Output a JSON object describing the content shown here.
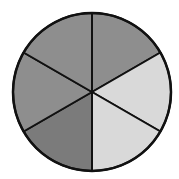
{
  "diagram": {
    "type": "fraction-circle",
    "total_sectors": 6,
    "center": [
      92,
      92
    ],
    "radius": 79,
    "stroke_color": "#111111",
    "stroke_width": 2,
    "sectors": [
      {
        "index": 0,
        "position": "top-right",
        "start_deg": -90,
        "end_deg": -30,
        "fill": "#8e8e8e",
        "shade": "dark"
      },
      {
        "index": 1,
        "position": "right-upper",
        "start_deg": -30,
        "end_deg": 30,
        "fill": "#d9d9d9",
        "shade": "light"
      },
      {
        "index": 2,
        "position": "bottom-right",
        "start_deg": 30,
        "end_deg": 90,
        "fill": "#d9d9d9",
        "shade": "light"
      },
      {
        "index": 3,
        "position": "bottom-left",
        "start_deg": 90,
        "end_deg": 150,
        "fill": "#7b7b7b",
        "shade": "darker"
      },
      {
        "index": 4,
        "position": "left",
        "start_deg": 150,
        "end_deg": 210,
        "fill": "#8e8e8e",
        "shade": "dark"
      },
      {
        "index": 5,
        "position": "top-left",
        "start_deg": 210,
        "end_deg": 270,
        "fill": "#8e8e8e",
        "shade": "dark"
      }
    ],
    "summary": {
      "dark_sectors": 4,
      "light_sectors": 2
    }
  }
}
